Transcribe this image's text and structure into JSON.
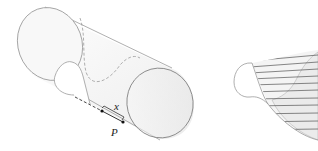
{
  "figure": {
    "left_panel": {
      "description": "cylinder-with-curve",
      "labels": {
        "segment": "x",
        "point": "P"
      }
    },
    "right_panel": {
      "description": "cross-section-slab"
    },
    "colors": {
      "outline": "#9a9a9a",
      "shade": "#f2f2f2",
      "hatch": "#555555",
      "ink": "#222222"
    }
  }
}
